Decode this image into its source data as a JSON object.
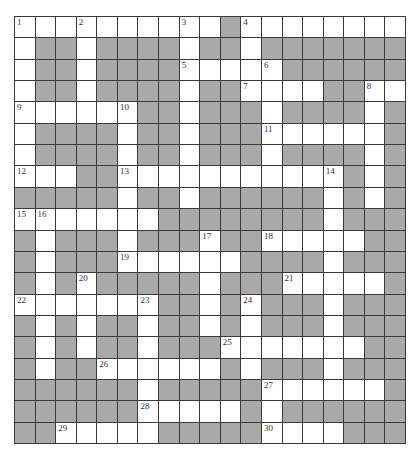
{
  "puzzle": {
    "rows": 20,
    "cols": 19,
    "colors": {
      "block": "#a9a9a9",
      "open": "#ffffff",
      "line": "#3a3a3a"
    },
    "grid": [
      "WWWWWWWWWWBWWWWWWWW",
      "WBBWBBBBWBBWBBBBBBB",
      "WBBWBBBBWWWWWBBBBBB",
      "WBBWBBBBWBBWWWWBBWW",
      "WWWWWWBBWBBBWBBBBWB",
      "WBBBBWBBWBBBWWWWWWB",
      "WBBBBWBBWBBBWBBBBWB",
      "WWWBBWWWWWWWWWWWBWB",
      "BBBBBWBBWBBBBBBWBWB",
      "WWWWWWWBBBBBBBBWBBB",
      "BWBBBWBBBWBBWWWWWBB",
      "BWBBBWWWWWWBBBBWBBB",
      "BWBWBBBBBWBBBWWWWWB",
      "WWWWWWWBBWBWBBBWBBB",
      "BWBWBBWBBWBWBBBWBBB",
      "BWBWBBWBBBWWWWWWWBB",
      "BWBBWWWWWWBWBBBWBBB",
      "BBBBBBWBBBBBWWWWWWB",
      "BBBBBBWWWWWBWBBBBBB",
      "BBWWWWWBBBBBWWWWBBB"
    ],
    "numbers": [
      {
        "r": 0,
        "c": 0,
        "n": "1"
      },
      {
        "r": 0,
        "c": 3,
        "n": "2"
      },
      {
        "r": 0,
        "c": 8,
        "n": "3"
      },
      {
        "r": 0,
        "c": 11,
        "n": "4"
      },
      {
        "r": 2,
        "c": 8,
        "n": "5"
      },
      {
        "r": 2,
        "c": 12,
        "n": "6"
      },
      {
        "r": 3,
        "c": 11,
        "n": "7"
      },
      {
        "r": 3,
        "c": 17,
        "n": "8"
      },
      {
        "r": 4,
        "c": 0,
        "n": "9"
      },
      {
        "r": 4,
        "c": 5,
        "n": "10"
      },
      {
        "r": 5,
        "c": 12,
        "n": "11"
      },
      {
        "r": 7,
        "c": 0,
        "n": "12"
      },
      {
        "r": 7,
        "c": 5,
        "n": "13"
      },
      {
        "r": 7,
        "c": 15,
        "n": "14"
      },
      {
        "r": 9,
        "c": 0,
        "n": "15"
      },
      {
        "r": 9,
        "c": 1,
        "n": "16"
      },
      {
        "r": 10,
        "c": 9,
        "n": "17"
      },
      {
        "r": 10,
        "c": 12,
        "n": "18"
      },
      {
        "r": 11,
        "c": 5,
        "n": "19"
      },
      {
        "r": 12,
        "c": 3,
        "n": "20"
      },
      {
        "r": 12,
        "c": 13,
        "n": "21"
      },
      {
        "r": 13,
        "c": 0,
        "n": "22"
      },
      {
        "r": 13,
        "c": 6,
        "n": "23"
      },
      {
        "r": 13,
        "c": 11,
        "n": "24"
      },
      {
        "r": 15,
        "c": 10,
        "n": "25"
      },
      {
        "r": 16,
        "c": 4,
        "n": "26"
      },
      {
        "r": 17,
        "c": 12,
        "n": "27"
      },
      {
        "r": 18,
        "c": 6,
        "n": "28"
      },
      {
        "r": 19,
        "c": 2,
        "n": "29"
      },
      {
        "r": 19,
        "c": 12,
        "n": "30"
      }
    ]
  }
}
